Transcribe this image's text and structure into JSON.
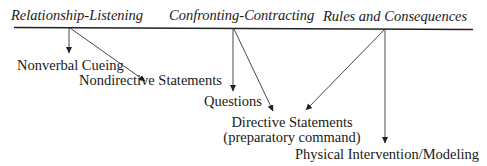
{
  "diagram": {
    "categories": [
      {
        "id": "relationship-listening",
        "label": "Relationship-Listening"
      },
      {
        "id": "confronting-contracting",
        "label": "Confronting-Contracting"
      },
      {
        "id": "rules-and-consequences",
        "label": "Rules and Consequences"
      }
    ],
    "techniques": [
      {
        "id": "nonverbal-cueing",
        "label": "Nonverbal Cueing"
      },
      {
        "id": "nondirective-statements",
        "label": "Nondirective Statements"
      },
      {
        "id": "questions",
        "label": "Questions"
      },
      {
        "id": "directive-statements",
        "label": "Directive Statements",
        "sublabel": "(preparatory command)"
      },
      {
        "id": "physical-intervention",
        "label": "Physical Intervention/Modeling"
      }
    ],
    "arrows": [
      {
        "from": "relationship-listening",
        "to": "nonverbal-cueing"
      },
      {
        "from": "relationship-listening",
        "to": "nondirective-statements"
      },
      {
        "from": "confronting-contracting",
        "to": "questions"
      },
      {
        "from": "confronting-contracting",
        "to": "directive-statements"
      },
      {
        "from": "rules-and-consequences",
        "to": "directive-statements"
      },
      {
        "from": "rules-and-consequences",
        "to": "physical-intervention"
      }
    ],
    "colors": {
      "line": "#222222",
      "text": "#1a1a1a",
      "background": "#ffffff"
    }
  }
}
